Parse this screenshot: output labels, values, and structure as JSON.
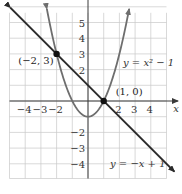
{
  "chart_data": {
    "type": "line",
    "title": "",
    "xlabel": "x",
    "ylabel": "",
    "xlim": [
      -5,
      5
    ],
    "ylim": [
      -5,
      6
    ],
    "grid": true,
    "x_ticks": [
      {
        "value": -4,
        "label": "−4"
      },
      {
        "value": -3,
        "label": "−3"
      },
      {
        "value": -2,
        "label": "−2"
      },
      {
        "value": 2,
        "label": "2"
      },
      {
        "value": 3,
        "label": "3"
      },
      {
        "value": 4,
        "label": "4"
      }
    ],
    "y_ticks": [
      {
        "value": 5,
        "label": "5"
      },
      {
        "value": 4,
        "label": "4"
      },
      {
        "value": 3,
        "label": "3"
      },
      {
        "value": 2,
        "label": "2"
      },
      {
        "value": -2,
        "label": "−2"
      },
      {
        "value": -3,
        "label": "−3"
      },
      {
        "value": -4,
        "label": "−4"
      }
    ],
    "series": [
      {
        "name": "parabola",
        "label": "y = x² − 1",
        "equation": "y = x^2 - 1",
        "x_range": [
          -2.62,
          2.62
        ],
        "color": "#6e6e6e"
      },
      {
        "name": "line",
        "label": "y = −x + 1",
        "equation": "y = -x + 1",
        "x_range": [
          -4.95,
          5.5
        ],
        "color": "#2b2b2b"
      }
    ],
    "points": [
      {
        "x": -2,
        "y": 3,
        "label": "(−2, 3)"
      },
      {
        "x": 1,
        "y": 0,
        "label": "(1, 0)"
      }
    ]
  }
}
